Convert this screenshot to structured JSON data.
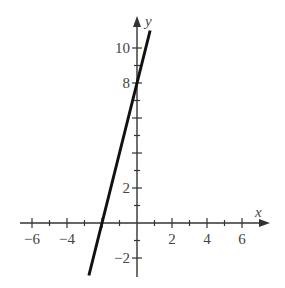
{
  "chart_data": {
    "type": "line",
    "title": "",
    "xlabel": "x",
    "ylabel": "y",
    "xlim": [
      -7.5,
      7.5
    ],
    "ylim": [
      -3.1,
      11.5
    ],
    "grid": false,
    "legend": null,
    "x_ticks": [
      -6,
      -5,
      -4,
      -3,
      -2,
      -1,
      1,
      2,
      3,
      4,
      5,
      6
    ],
    "x_tick_labels": [
      {
        "value": -6,
        "label": "−6"
      },
      {
        "value": -4,
        "label": "−4"
      },
      {
        "value": 2,
        "label": "2"
      },
      {
        "value": 4,
        "label": "4"
      },
      {
        "value": 6,
        "label": "6"
      }
    ],
    "y_ticks": [
      -2,
      -1,
      1,
      2,
      3,
      4,
      5,
      6,
      7,
      8,
      9,
      10
    ],
    "y_tick_labels": [
      {
        "value": 10,
        "label": "10"
      },
      {
        "value": 8,
        "label": "8"
      },
      {
        "value": 2,
        "label": "2"
      },
      {
        "value": -2,
        "label": "−2"
      }
    ],
    "series": [
      {
        "name": "y = 4x + 8",
        "equation": "y = 4x + 8",
        "slope": 4,
        "y_intercept": 8,
        "x_intercept": -2,
        "x": [
          -2.75,
          0.75
        ],
        "y": [
          -3.0,
          11.0
        ],
        "color": "#111111"
      }
    ]
  },
  "colors": {
    "axis": "#333333",
    "line": "#111111",
    "text": "#444444"
  }
}
